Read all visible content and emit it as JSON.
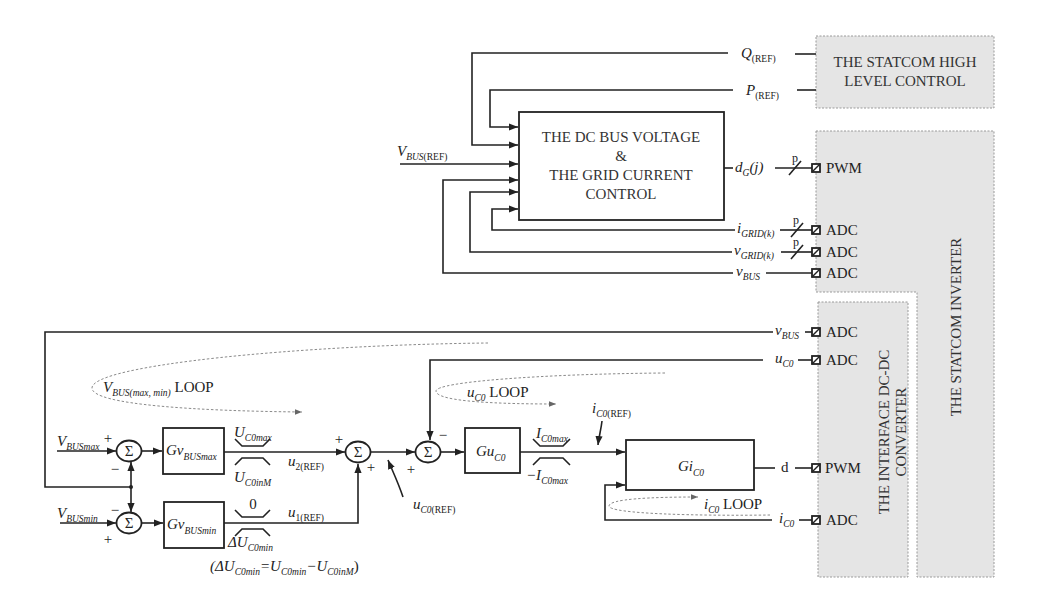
{
  "blocks": {
    "high_level_control": {
      "line1": "THE STATCOM HIGH",
      "line2": "LEVEL CONTROL"
    },
    "dc_bus_grid_control": {
      "line1": "THE DC BUS VOLTAGE",
      "line2": "&",
      "line3": "THE GRID CURRENT",
      "line4": "CONTROL"
    },
    "statcom_inverter": {
      "label": "THE STATCOM INVERTER"
    },
    "interface_converter": {
      "line1": "THE INTERFACE DC-DC",
      "line2": "CONVERTER"
    },
    "gv_busmax": {
      "main": "Gv",
      "sub": "BUSmax"
    },
    "gv_busmin": {
      "main": "Gv",
      "sub": "BUSmin"
    },
    "gu_c0": {
      "main": "Gu",
      "sub": "C0"
    },
    "gi_c0": {
      "main": "Gi",
      "sub": "C0"
    }
  },
  "signals": {
    "q_ref": {
      "main": "Q",
      "sub": "(REF)"
    },
    "p_ref": {
      "main": "P",
      "sub": "(REF)"
    },
    "vbus_ref": {
      "main": "V",
      "sub": "BUS",
      "sub2": "(REF)"
    },
    "dg_j": {
      "main": "d",
      "sub": "G",
      "suffix": "(j)"
    },
    "i_grid": {
      "main": "i",
      "sub": "GRID(k)"
    },
    "v_grid": {
      "main": "v",
      "sub": "GRID(k)"
    },
    "v_bus_inverter": {
      "main": "v",
      "sub": "BUS"
    },
    "v_bus_converter": {
      "main": "v",
      "sub": "BUS"
    },
    "u_c0": {
      "main": "u",
      "sub": "C0"
    },
    "d": "d",
    "i_c0": {
      "main": "i",
      "sub": "C0"
    },
    "vbus_max": {
      "main": "V",
      "sub": "BUSmax"
    },
    "vbus_min": {
      "main": "V",
      "sub": "BUSmin"
    },
    "u2_ref": {
      "main": "u",
      "sub": "2(REF)"
    },
    "u1_ref": {
      "main": "u",
      "sub": "1(REF)"
    },
    "uc0_ref": {
      "main": "u",
      "sub": "C0",
      "sub2": "(REF)"
    },
    "ic0_ref": {
      "main": "i",
      "sub": "C0",
      "sub2": "(REF)"
    }
  },
  "limits": {
    "uc0max": {
      "main": "U",
      "sub": "C0max"
    },
    "uc0inm": {
      "main": "U",
      "sub": "C0inM"
    },
    "zero": "0",
    "delta_uc0min": {
      "main": "ΔU",
      "sub": "C0min"
    },
    "ic0max": {
      "main": "I",
      "sub": "C0max"
    },
    "neg_ic0max": {
      "main": "−I",
      "sub": "C0max"
    }
  },
  "formula": {
    "p1": "(ΔU",
    "s1": "C0min",
    "p2": "=U",
    "s2": "C0min",
    "p3": "−U",
    "s3": "C0inM",
    "p4": ")"
  },
  "loops": {
    "vbus": {
      "main": "V",
      "sub": "BUS(max, min)",
      "suffix": " LOOP"
    },
    "uc0": {
      "main": "u",
      "sub": "C0",
      "suffix": " LOOP"
    },
    "ic0": {
      "main": "i",
      "sub": "C0",
      "suffix": " LOOP"
    }
  },
  "ports": {
    "pwm_dg": "PWM",
    "adc_igrid": "ADC",
    "adc_vgrid": "ADC",
    "adc_vbus_inv": "ADC",
    "adc_vbus_conv": "ADC",
    "adc_uc0": "ADC",
    "pwm_d": "PWM",
    "adc_ic0": "ADC"
  },
  "bus_width": "p",
  "summer": {
    "symbol": "Σ"
  },
  "signs": {
    "plus": "+",
    "minus": "−"
  },
  "colors": {
    "line": "#222222",
    "module_fill": "#e5e5e5",
    "module_border": "#9a9a9a",
    "loop_dash": "#8a8a8a"
  }
}
